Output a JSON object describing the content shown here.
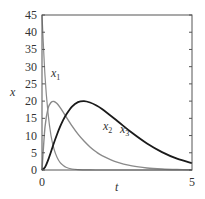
{
  "chart_data": {
    "type": "line",
    "title": "",
    "xlabel": "t",
    "ylabel": "x",
    "xlim": [
      0,
      5
    ],
    "ylim": [
      0,
      45
    ],
    "grid": false,
    "legend": "inline labels",
    "x_ticks": [
      0,
      5
    ],
    "y_ticks": [
      0,
      5,
      10,
      15,
      20,
      25,
      30,
      35,
      40,
      45
    ],
    "x": [
      0,
      0.1,
      0.2,
      0.3,
      0.4,
      0.5,
      0.6,
      0.7,
      0.8,
      1.0,
      1.2,
      1.4,
      1.6,
      1.8,
      2.0,
      2.5,
      3.0,
      3.5,
      4.0,
      4.5,
      5.0
    ],
    "series": [
      {
        "name": "x1",
        "label_main": "x",
        "label_sub": "1",
        "color": "#8a8a8a",
        "width": 1.2,
        "label_pos": [
          1.55,
          26.5
        ],
        "values": [
          45,
          27.3,
          16.6,
          10.0,
          6.1,
          3.7,
          2.2,
          1.4,
          0.8,
          0.3,
          0.1,
          0.04,
          0.01,
          0,
          0,
          0,
          0,
          0,
          0,
          0,
          0
        ]
      },
      {
        "name": "x2",
        "label_main": "x",
        "label_sub": "2",
        "color": "#8a8a8a",
        "width": 1.4,
        "label_pos": [
          2.9,
          11.5
        ],
        "values": [
          0,
          12.5,
          17.8,
          19.6,
          19.9,
          19.3,
          18.2,
          16.9,
          15.5,
          12.8,
          10.4,
          8.4,
          6.7,
          5.3,
          4.2,
          2.3,
          1.2,
          0.6,
          0.3,
          0.15,
          0.08
        ]
      },
      {
        "name": "x3",
        "label_main": "x",
        "label_sub": "3",
        "color": "#1a1a1a",
        "width": 1.8,
        "label_pos": [
          3.45,
          7.5
        ],
        "values": [
          0,
          0.8,
          2.8,
          5.3,
          7.9,
          10.3,
          12.5,
          14.4,
          16.0,
          18.4,
          19.7,
          20.0,
          19.6,
          18.8,
          17.7,
          14.3,
          10.8,
          7.7,
          5.2,
          3.3,
          2.0
        ]
      }
    ]
  }
}
